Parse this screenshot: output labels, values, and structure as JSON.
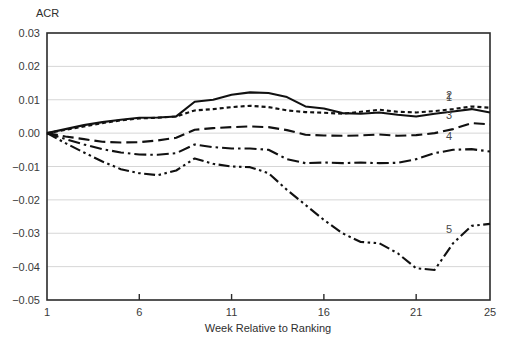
{
  "figure": {
    "y_axis_caption": "ACR",
    "x_axis_title": "Week Relative to Ranking"
  },
  "axes": {
    "y_ticks": [
      "0.03",
      "0.02",
      "0.01",
      "0.00",
      "-0.01",
      "-0.02",
      "-0.03",
      "-0.04",
      "-0.05"
    ],
    "x_ticks": [
      "1",
      "6",
      "11",
      "16",
      "21",
      "25"
    ]
  },
  "series_labels": [
    {
      "name": "label-series-2",
      "text": "2"
    },
    {
      "name": "label-series-1",
      "text": "1"
    },
    {
      "name": "label-series-3",
      "text": "3"
    },
    {
      "name": "label-series-4",
      "text": "4"
    },
    {
      "name": "label-series-5",
      "text": "5"
    }
  ],
  "chart_data": {
    "type": "line",
    "title": "",
    "subtitle": "",
    "xlabel": "Week Relative to Ranking",
    "ylabel": "ACR",
    "xlim": [
      1,
      25
    ],
    "ylim": [
      -0.05,
      0.03
    ],
    "grid": true,
    "legend_position": "inline-right-end-labels",
    "x": [
      1,
      2,
      3,
      4,
      5,
      6,
      7,
      8,
      9,
      10,
      11,
      12,
      13,
      14,
      15,
      16,
      17,
      18,
      19,
      20,
      21,
      22,
      23,
      24,
      25
    ],
    "series": [
      {
        "name": "1",
        "label": "1",
        "line_style": "solid",
        "color": "#111111",
        "values": [
          0.0,
          0.0012,
          0.0024,
          0.0033,
          0.004,
          0.0046,
          0.0047,
          0.005,
          0.0094,
          0.01,
          0.0115,
          0.0122,
          0.012,
          0.0108,
          0.008,
          0.0074,
          0.006,
          0.0058,
          0.0062,
          0.0055,
          0.005,
          0.0058,
          0.0065,
          0.0072,
          0.0062
        ]
      },
      {
        "name": "2",
        "label": "2",
        "line_style": "dotted",
        "color": "#111111",
        "values": [
          0.0,
          0.001,
          0.002,
          0.003,
          0.0038,
          0.0044,
          0.0046,
          0.005,
          0.0068,
          0.0072,
          0.0078,
          0.0082,
          0.0078,
          0.0068,
          0.0063,
          0.0061,
          0.0058,
          0.0064,
          0.007,
          0.0064,
          0.0062,
          0.0066,
          0.0072,
          0.008,
          0.0076
        ]
      },
      {
        "name": "3",
        "label": "3",
        "line_style": "long-dash",
        "color": "#111111",
        "values": [
          0.0,
          -0.001,
          -0.0018,
          -0.0026,
          -0.0028,
          -0.0027,
          -0.0022,
          -0.0014,
          0.001,
          0.0015,
          0.0018,
          0.002,
          0.0018,
          0.0009,
          -0.0005,
          -0.0007,
          -0.0008,
          -0.0007,
          -0.0004,
          -0.0008,
          -0.0006,
          0.0,
          0.0012,
          0.003,
          0.0026
        ]
      },
      {
        "name": "4",
        "label": "4",
        "line_style": "dash-dot",
        "color": "#111111",
        "values": [
          0.0,
          -0.0018,
          -0.0034,
          -0.0048,
          -0.0058,
          -0.0064,
          -0.0065,
          -0.006,
          -0.0034,
          -0.0042,
          -0.0046,
          -0.0046,
          -0.005,
          -0.0078,
          -0.009,
          -0.0088,
          -0.009,
          -0.0088,
          -0.009,
          -0.0089,
          -0.0078,
          -0.006,
          -0.005,
          -0.0048,
          -0.0055
        ]
      },
      {
        "name": "5",
        "label": "5",
        "line_style": "dash-dot-dot",
        "color": "#111111",
        "values": [
          0.0,
          -0.003,
          -0.0058,
          -0.0085,
          -0.0108,
          -0.012,
          -0.0126,
          -0.0112,
          -0.0076,
          -0.0092,
          -0.01,
          -0.0102,
          -0.012,
          -0.017,
          -0.0215,
          -0.026,
          -0.03,
          -0.0326,
          -0.033,
          -0.036,
          -0.0405,
          -0.041,
          -0.033,
          -0.0278,
          -0.0272
        ]
      }
    ]
  }
}
